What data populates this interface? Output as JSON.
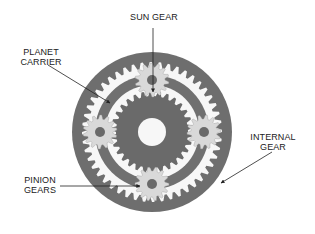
{
  "labels": {
    "sun_gear": "SUN GEAR",
    "planet_carrier_line1": "PLANET",
    "planet_carrier_line2": "CARRIER",
    "internal_gear_line1": "INTERNAL",
    "internal_gear_line2": "GEAR",
    "pinion_gears_line1": "PINION",
    "pinion_gears_line2": "GEARS"
  },
  "colors": {
    "ring_dark": "#6e6e6e",
    "carrier_dark": "#707070",
    "sun_dark": "#6a6a6a",
    "pinion_light": "#d9d9d9",
    "pinion_hub": "#6a6a6a",
    "gap_white": "#f7f7f7",
    "pointer": "#333333"
  }
}
